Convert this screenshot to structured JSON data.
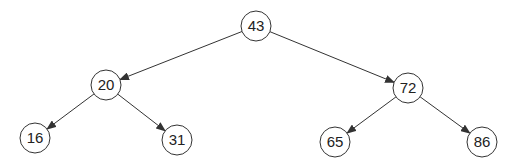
{
  "diagram": {
    "type": "binary-search-tree",
    "node_radius": 15,
    "colors": {
      "stroke": "#333333",
      "fill": "#ffffff",
      "text": "#222222"
    },
    "nodes": [
      {
        "id": "n43",
        "label": "43",
        "cx": 256,
        "cy": 26
      },
      {
        "id": "n20",
        "label": "20",
        "cx": 106,
        "cy": 85
      },
      {
        "id": "n72",
        "label": "72",
        "cx": 408,
        "cy": 88
      },
      {
        "id": "n16",
        "label": "16",
        "cx": 35,
        "cy": 138
      },
      {
        "id": "n31",
        "label": "31",
        "cx": 177,
        "cy": 140
      },
      {
        "id": "n65",
        "label": "65",
        "cx": 335,
        "cy": 142
      },
      {
        "id": "n86",
        "label": "86",
        "cx": 482,
        "cy": 142
      }
    ],
    "edges": [
      {
        "from": "n43",
        "to": "n20"
      },
      {
        "from": "n43",
        "to": "n72"
      },
      {
        "from": "n20",
        "to": "n16"
      },
      {
        "from": "n20",
        "to": "n31"
      },
      {
        "from": "n72",
        "to": "n65"
      },
      {
        "from": "n72",
        "to": "n86"
      }
    ]
  }
}
